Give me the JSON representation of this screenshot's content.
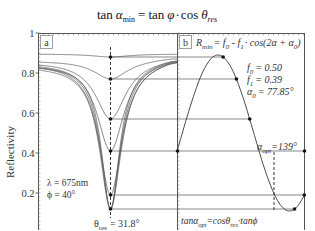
{
  "title": {
    "lhs_func": "tan",
    "lhs_var": "α",
    "lhs_sub": "min",
    "eq": "=",
    "rhs1_func": "tan",
    "rhs1_var": "φ",
    "dot": "·",
    "rhs2_func": "cos",
    "rhs2_var": "θ",
    "rhs2_sub": "res"
  },
  "chart_data": [
    {
      "panel": "a",
      "type": "line",
      "ylabel": "Reflectivity",
      "xlabel": "",
      "ylim": [
        0,
        1
      ],
      "yticks": [
        {
          "value": 1,
          "label": "1"
        },
        {
          "value": 0.8,
          "label": "0.8"
        },
        {
          "value": 0.6,
          "label": "0.6"
        },
        {
          "value": 0.4,
          "label": "0.4"
        },
        {
          "value": 0.2,
          "label": "0.2"
        }
      ],
      "annotations": {
        "panel_label": "a",
        "lambda": "λ = 675nm",
        "phi": "ϕ = 40°",
        "theta_label": "θ",
        "theta_sub": "res",
        "theta_value": "= 31.8°"
      },
      "resonance_angle_deg": 31.8,
      "series_minima": [
        0.88,
        0.77,
        0.57,
        0.41,
        0.19,
        0.12,
        0.12,
        0.12
      ],
      "baseline_left": 0.865,
      "baseline_right": 0.88,
      "grid": false
    },
    {
      "panel": "b",
      "type": "line",
      "formula_label": "b",
      "formula": {
        "R": "R",
        "R_sub": "min",
        "rest1": "= f",
        "f0_sub": "0",
        "minus": " - f",
        "f1_sub": "1",
        "rest2": "· cos(2α + α",
        "a0_sub": "0",
        "close": ")"
      },
      "params": {
        "f0_label": "f",
        "f0_sub": "0",
        "f0_value": "= 0.50",
        "f1_label": "f",
        "f1_sub": "1",
        "f1_value": "= 0.39",
        "a0_label": "α",
        "a0_sub": "0",
        "a0_value": "= 77.85°"
      },
      "f0": 0.5,
      "f1": 0.39,
      "alpha0_deg": 77.85,
      "alpha_opt": {
        "label": "α",
        "sub": "opt",
        "value": "=139°",
        "deg": 139
      },
      "bottom_formula": {
        "p1": "tanα",
        "s1": "opt",
        "p2": "=cosθ",
        "s2": "res",
        "p3": "·tanϕ"
      },
      "points_R": [
        0.88,
        0.77,
        0.57,
        0.41,
        0.19,
        0.12
      ],
      "grid": false
    }
  ]
}
